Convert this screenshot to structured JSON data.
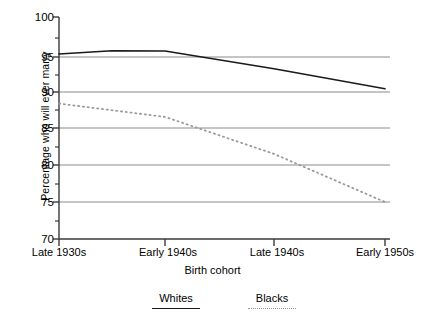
{
  "chart_data": {
    "type": "line",
    "title": "",
    "xlabel": "Birth cohort",
    "ylabel": "Percentage who will ever marry",
    "categories": [
      "Late 1930s",
      "Early 1940s",
      "Late 1940s",
      "Early 1950s"
    ],
    "ylim": [
      70,
      100
    ],
    "yticks": [
      70,
      75,
      80,
      85,
      90,
      95,
      100
    ],
    "ytick_labels": [
      "70",
      "75",
      "80",
      "85",
      "90",
      "95",
      "100"
    ],
    "grid": "horizontal",
    "legend_position": "bottom",
    "series": [
      {
        "name": "Whites",
        "style": "solid",
        "color": "#1a1a1a",
        "values": [
          95.0,
          95.4,
          93.0,
          90.3
        ]
      },
      {
        "name": "Blacks",
        "style": "dotted",
        "color": "#9a9a9a",
        "values": [
          88.3,
          86.5,
          81.5,
          75.0
        ]
      }
    ]
  },
  "axis": {
    "y_title": "Percentage who will ever marry",
    "x_title": "Birth cohort",
    "y_tick_0": "70",
    "y_tick_1": "75",
    "y_tick_2": "80",
    "y_tick_3": "85",
    "y_tick_4": "90",
    "y_tick_5": "95",
    "y_tick_6": "100",
    "x_tick_0": "Late 1930s",
    "x_tick_1": "Early 1940s",
    "x_tick_2": "Late 1940s",
    "x_tick_3": "Early 1950s"
  },
  "legend": {
    "entry_0": "Whites",
    "entry_1": "Blacks"
  },
  "colors": {
    "whites_line": "#1a1a1a",
    "blacks_line": "#9a9a9a",
    "grid": "#8a8a8a",
    "axis": "#3a3a3a",
    "background": "#ffffff"
  }
}
